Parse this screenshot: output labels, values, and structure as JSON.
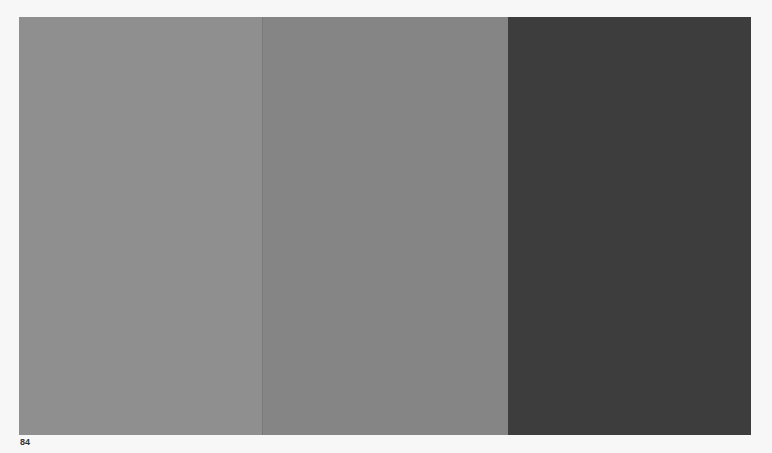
{
  "panels": [
    {
      "name": "light-gray",
      "color": "#8f8f8f"
    },
    {
      "name": "mid-gray",
      "color": "#858585"
    },
    {
      "name": "dark-gray",
      "color": "#3d3d3d"
    }
  ],
  "page_number": "84"
}
